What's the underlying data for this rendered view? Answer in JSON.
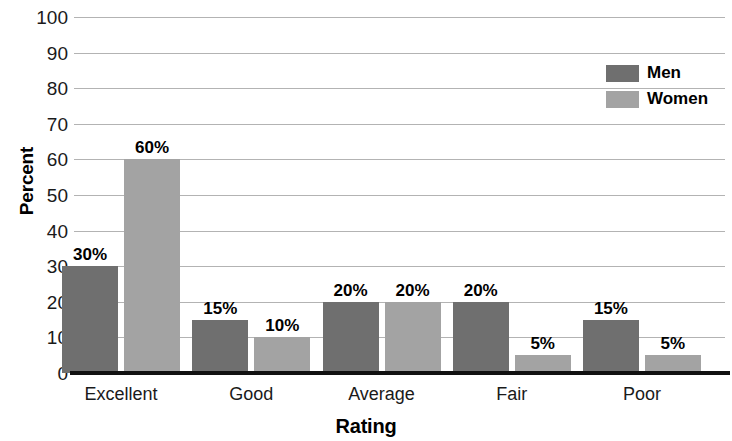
{
  "chart_data": {
    "type": "bar",
    "title": "",
    "xlabel": "Rating",
    "ylabel": "Percent",
    "categories": [
      "Excellent",
      "Good",
      "Average",
      "Fair",
      "Poor"
    ],
    "series": [
      {
        "name": "Men",
        "color": "#6f6f6f",
        "values": [
          30,
          15,
          20,
          20,
          15
        ],
        "labels": [
          "30%",
          "15%",
          "20%",
          "20%",
          "15%"
        ]
      },
      {
        "name": "Women",
        "color": "#a3a3a3",
        "values": [
          60,
          10,
          20,
          5,
          5
        ],
        "labels": [
          "60%",
          "10%",
          "20%",
          "5%",
          "5%"
        ]
      }
    ],
    "ylim": [
      0,
      100
    ],
    "yticks": [
      100,
      90,
      80,
      70,
      60,
      50,
      40,
      30,
      20,
      10,
      0
    ],
    "ytick_labels": [
      "100",
      "90",
      "80",
      "70",
      "60",
      "50",
      "40",
      "30",
      "20",
      "10",
      "0"
    ],
    "grid": true,
    "legend_position": "top-right",
    "legend_entries": [
      "Men",
      "Women"
    ],
    "gridline_color": "#b3b3b3",
    "axis_color": "#111111",
    "background": "#ffffff"
  }
}
